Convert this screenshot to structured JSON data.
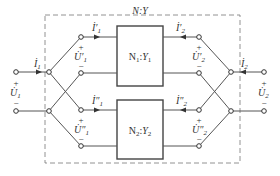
{
  "diagram": {
    "outer_network_label": "N:Y",
    "subnetworks": [
      {
        "name": "N1",
        "label_main": "N",
        "label_sub": "1",
        "label_sep": ":",
        "label_y": "Y",
        "label_y_sub": "1"
      },
      {
        "name": "N2",
        "label_main": "N",
        "label_sub": "2",
        "label_sep": ":",
        "label_y": "Y",
        "label_y_sub": "2"
      }
    ],
    "port1": {
      "current": {
        "sym": "İ",
        "sub": "1"
      },
      "voltage": {
        "sym": "U̇",
        "sub": "1"
      },
      "plus": "+",
      "minus": "−"
    },
    "port2": {
      "current": {
        "sym": "İ",
        "sub": "2"
      },
      "voltage": {
        "sym": "U̇",
        "sub": "2"
      },
      "plus": "+",
      "minus": "−"
    },
    "n1_port1": {
      "current": {
        "sym": "İ′",
        "sub": "1"
      },
      "voltage": {
        "sym": "U̇′",
        "sub": "1"
      },
      "plus": "+",
      "minus": "−"
    },
    "n1_port2": {
      "current": {
        "sym": "İ′",
        "sub": "2"
      },
      "voltage": {
        "sym": "U̇′",
        "sub": "2"
      },
      "plus": "+",
      "minus": "−"
    },
    "n2_port1": {
      "current": {
        "sym": "İ″",
        "sub": "1"
      },
      "voltage": {
        "sym": "U̇″",
        "sub": "1"
      },
      "plus": "+",
      "minus": "−"
    },
    "n2_port2": {
      "current": {
        "sym": "İ″",
        "sub": "2"
      },
      "voltage": {
        "sym": "U̇″",
        "sub": "2"
      },
      "plus": "+",
      "minus": "−"
    }
  }
}
